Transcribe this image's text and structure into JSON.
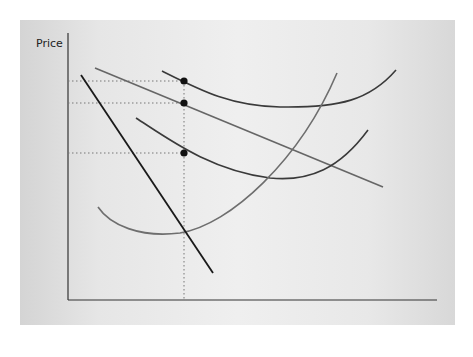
{
  "diagram": {
    "type": "economics-monopolistic-competition",
    "axes": {
      "y_label": "Price",
      "x_label": "Quantity",
      "origin_label": "0"
    },
    "price_levels": [
      {
        "id": "C1",
        "base": "C",
        "sub": "1"
      },
      {
        "id": "P0",
        "base": "P",
        "sub": "0"
      },
      {
        "id": "C0",
        "base": "C",
        "sub": "0"
      }
    ],
    "quantity_levels": [
      {
        "id": "QE",
        "base": "Q",
        "sub": "E"
      }
    ],
    "points": [
      {
        "label": "G"
      },
      {
        "label": "F"
      },
      {
        "label": "H"
      }
    ],
    "curves": {
      "mc": {
        "label": "MC"
      },
      "srac1": {
        "base": "SRAC",
        "sub": "1"
      },
      "srac0": {
        "base": "SRAC",
        "sub": "0"
      },
      "demand": {
        "label": "D = AR"
      },
      "mr": {
        "label": "MR"
      }
    },
    "colors": {
      "mr_line": "#1a1a1a",
      "curve_dark": "#3a3a3a",
      "curve_gray": "#6e6e6e",
      "guide_dotted": "#777777",
      "point": "#111111"
    }
  }
}
